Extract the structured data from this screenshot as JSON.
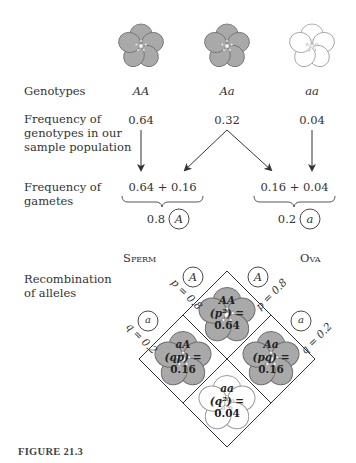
{
  "figure": {
    "caption": "FIGURE 21.3",
    "colors": {
      "dominant_petal": "#a9a9a9",
      "dominant_petal_outline": "#6f6f6f",
      "recessive_petal": "#ffffff",
      "recessive_petal_outline": "#9a9a9a",
      "line": "#333333"
    }
  },
  "rows": {
    "genotypes_label": "Genotypes",
    "frequency_genotypes_label_1": "Frequency of",
    "frequency_genotypes_label_2": "genotypes in our",
    "frequency_genotypes_label_3": "sample population",
    "frequency_gametes_label_1": "Frequency of",
    "frequency_gametes_label_2": "gametes",
    "recombination_label_1": "Recombination",
    "recombination_label_2": "of alleles"
  },
  "genotypes": [
    {
      "name": "AA",
      "frequency": "0.64",
      "flower": "dominant"
    },
    {
      "name": "Aa",
      "frequency": "0.32",
      "flower": "dominant"
    },
    {
      "name": "aa",
      "frequency": "0.04",
      "flower": "recessive"
    }
  ],
  "gametes": [
    {
      "sum": "0.64 + 0.16",
      "value": "0.8",
      "allele": "A"
    },
    {
      "sum": "0.16 + 0.04",
      "value": "0.2",
      "allele": "a"
    }
  ],
  "punnett": {
    "sperm_label": "Sperm",
    "ova_label": "Ova",
    "sperm_alleles": [
      {
        "allele": "A",
        "freq_label": "p = 0.8"
      },
      {
        "allele": "a",
        "freq_label": "q = 0.2"
      }
    ],
    "ova_alleles": [
      {
        "allele": "A",
        "freq_label": "p = 0.8"
      },
      {
        "allele": "a",
        "freq_label": "q = 0.2"
      }
    ],
    "cells": [
      {
        "genotype": "AA",
        "expr": "(p²) =",
        "value": "0.64",
        "flower": "dominant"
      },
      {
        "genotype": "aA",
        "expr": "(qp) =",
        "value": "0.16",
        "flower": "dominant"
      },
      {
        "genotype": "Aa",
        "expr": "(pq) =",
        "value": "0.16",
        "flower": "dominant"
      },
      {
        "genotype": "aa",
        "expr": "(q²) =",
        "value": "0.04",
        "flower": "recessive"
      }
    ]
  }
}
